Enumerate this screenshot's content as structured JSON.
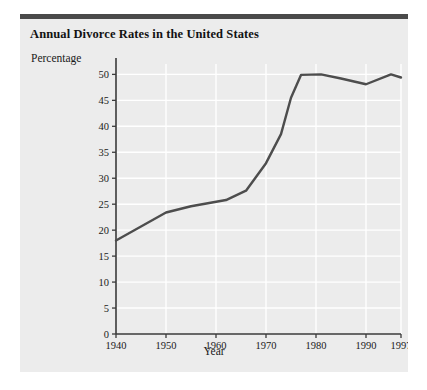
{
  "card": {
    "title": "Annual Divorce Rates in the United States",
    "accent_bar_color": "#4a4a4a",
    "background_color": "#ececec"
  },
  "chart_data": {
    "type": "line",
    "title": "Annual Divorce Rates in the United States",
    "xlabel": "Year",
    "ylabel": "Percentage",
    "grid": true,
    "legend": "none",
    "line_color": "#4d4d4d",
    "xlim": [
      1940,
      1997
    ],
    "ylim": [
      0,
      52
    ],
    "xticks": [
      1940,
      1950,
      1960,
      1970,
      1980,
      1990,
      1997
    ],
    "xtick_labels": [
      "1940",
      "1950",
      "1960",
      "1970",
      "1980",
      "1990",
      "1997"
    ],
    "yticks": [
      0,
      5,
      10,
      15,
      20,
      25,
      30,
      35,
      40,
      45,
      50
    ],
    "ytick_labels": [
      "0",
      "5",
      "10",
      "15",
      "20",
      "25",
      "30",
      "35",
      "40",
      "45",
      "50"
    ],
    "series": [
      {
        "name": "Annual divorce rate",
        "x": [
          1940,
          1950,
          1955,
          1962,
          1966,
          1970,
          1973,
          1975,
          1977,
          1981,
          1985,
          1990,
          1995,
          1997
        ],
        "values": [
          18.0,
          23.4,
          24.6,
          25.8,
          27.6,
          32.9,
          38.5,
          45.5,
          49.9,
          50.0,
          49.2,
          48.1,
          50.0,
          49.4
        ]
      }
    ]
  }
}
